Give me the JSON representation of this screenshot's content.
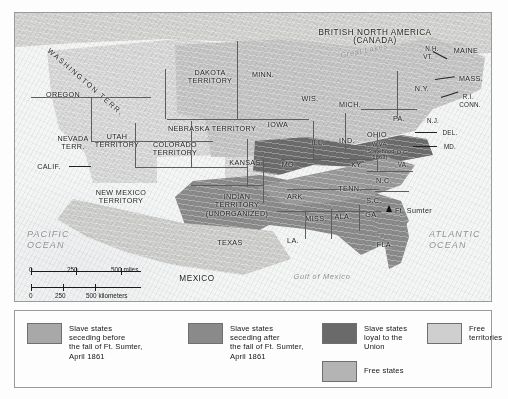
{
  "map": {
    "colors": {
      "seceded_before": "#8e8e8e",
      "seceded_after": "#9d9d9d",
      "loyal_slave": "#6e6e6e",
      "free_states": "#c9c9c9",
      "free_territories": "#dcdcdc",
      "frame": "#9a9a9a",
      "water_label": "#8d8f92"
    },
    "country_labels": [
      {
        "name": "british-north-america",
        "text": "BRITISH NORTH AMERICA\n(CANADA)"
      },
      {
        "name": "mexico",
        "text": "MEXICO"
      }
    ],
    "water_labels": [
      {
        "name": "pacific-ocean",
        "text": "PACIFIC\nOCEAN"
      },
      {
        "name": "atlantic-ocean",
        "text": "ATLANTIC\nOCEAN"
      },
      {
        "name": "gulf-of-mexico",
        "text": "Gulf of Mexico"
      },
      {
        "name": "great-lakes",
        "text": "Great Lakes"
      }
    ],
    "territory_labels": [
      {
        "name": "washington-territory",
        "text": "WASHINGTON TERR."
      },
      {
        "name": "oregon",
        "text": "OREGON"
      },
      {
        "name": "nevada-territory",
        "text": "NEVADA\nTERR."
      },
      {
        "name": "california",
        "text": "CALIF."
      },
      {
        "name": "utah-territory",
        "text": "UTAH\nTERRITORY"
      },
      {
        "name": "colorado-territory",
        "text": "COLORADO\nTERRITORY"
      },
      {
        "name": "new-mexico-territory",
        "text": "NEW MEXICO\nTERRITORY"
      },
      {
        "name": "dakota-territory",
        "text": "DAKOTA\nTERRITORY"
      },
      {
        "name": "nebraska-territory",
        "text": "NEBRASKA TERRITORY"
      },
      {
        "name": "indian-territory",
        "text": "INDIAN\nTERRITORY\n(UNORGANIZED)"
      },
      {
        "name": "kansas",
        "text": "KANSAS"
      },
      {
        "name": "texas",
        "text": "TEXAS"
      },
      {
        "name": "minnesota",
        "text": "MINN."
      },
      {
        "name": "wisconsin",
        "text": "WIS."
      },
      {
        "name": "iowa",
        "text": "IOWA"
      },
      {
        "name": "michigan",
        "text": "MICH."
      },
      {
        "name": "illinois",
        "text": "ILL."
      },
      {
        "name": "indiana",
        "text": "IND."
      },
      {
        "name": "ohio",
        "text": "OHIO"
      },
      {
        "name": "missouri",
        "text": "MO."
      },
      {
        "name": "kentucky",
        "text": "KY."
      },
      {
        "name": "tennessee",
        "text": "TENN."
      },
      {
        "name": "arkansas",
        "text": "ARK."
      },
      {
        "name": "mississippi",
        "text": "MISS."
      },
      {
        "name": "alabama",
        "text": "ALA."
      },
      {
        "name": "georgia",
        "text": "GA."
      },
      {
        "name": "louisiana",
        "text": "LA."
      },
      {
        "name": "florida",
        "text": "FLA."
      },
      {
        "name": "north-carolina",
        "text": "N.C."
      },
      {
        "name": "south-carolina",
        "text": "S.C."
      },
      {
        "name": "virginia",
        "text": "VA."
      },
      {
        "name": "west-virginia",
        "text": "W.VA.\n(Statehood\n1863)"
      },
      {
        "name": "district-of-columbia",
        "text": "D.C."
      },
      {
        "name": "pennsylvania",
        "text": "PA."
      },
      {
        "name": "new-york",
        "text": "N.Y."
      },
      {
        "name": "new-hampshire",
        "text": "N.H."
      },
      {
        "name": "vermont",
        "text": "VT."
      },
      {
        "name": "maine",
        "text": "MAINE"
      },
      {
        "name": "massachusetts",
        "text": "MASS."
      },
      {
        "name": "rhode-island",
        "text": "R.I."
      },
      {
        "name": "connecticut",
        "text": "CONN."
      },
      {
        "name": "new-jersey",
        "text": "N.J."
      },
      {
        "name": "delaware",
        "text": "DEL."
      },
      {
        "name": "maryland",
        "text": "MD."
      }
    ],
    "point_labels": [
      {
        "name": "fort-sumter",
        "text": "Ft. Sumter"
      }
    ]
  },
  "scale": {
    "miles": {
      "ticks": [
        "0",
        "250",
        "500 miles"
      ]
    },
    "kilometers": {
      "ticks": [
        "0",
        "250",
        "500 kilometers"
      ]
    }
  },
  "legend": {
    "items": [
      {
        "name": "slave-states-seceding-before",
        "label": "Slave states\nseceding before\nthe fall of Ft. Sumter,\nApril 1861",
        "color": "#a8a8a8"
      },
      {
        "name": "slave-states-seceding-after",
        "label": "Slave states\nseceding after\nthe fall of Ft. Sumter,\nApril 1861",
        "color": "#8a8a8a"
      },
      {
        "name": "slave-states-loyal-to-union",
        "label": "Slave states\nloyal to the\nUnion",
        "color": "#6a6a6a"
      },
      {
        "name": "free-states",
        "label": "Free states",
        "color": "#b4b4b4"
      },
      {
        "name": "free-territories",
        "label": "Free\nterritories",
        "color": "#cfcfcf"
      }
    ]
  }
}
